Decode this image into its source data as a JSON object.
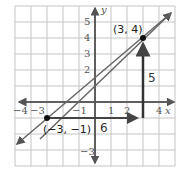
{
  "diagram": {
    "type": "coordinate-plane-slope",
    "x_axis_label": "x",
    "y_axis_label": "y",
    "x_ticks": [
      "−4",
      "−3",
      "−1",
      "1",
      "2",
      "4"
    ],
    "y_ticks": [
      "5",
      "4",
      "3",
      "2",
      "−3"
    ],
    "points": [
      {
        "label": "(3, 4)",
        "x": 3,
        "y": 4
      },
      {
        "label": "(−3, −1)",
        "x": -3,
        "y": -1
      }
    ],
    "rise_label": "5",
    "run_label": "6",
    "line_color": "#555555",
    "grid_color": "#bbbbbb"
  }
}
